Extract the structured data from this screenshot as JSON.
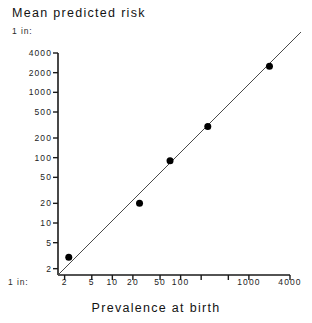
{
  "chart_data": {
    "type": "scatter",
    "title": "Mean predicted risk",
    "xlabel": "Prevalence at birth",
    "ylabel": "Mean predicted risk",
    "x_unit_prefix": "1 in:",
    "y_unit_prefix": "1 in:",
    "xscale": "log",
    "yscale": "log",
    "x_inverted_meaning": "1 in N, larger N to the right",
    "y_inverted_meaning": "1 in N, larger N upward",
    "xlim": [
      1.6,
      4000
    ],
    "ylim": [
      1.6,
      4000
    ],
    "grid": false,
    "legend": null,
    "xticks": [
      2,
      5,
      10,
      20,
      50,
      100,
      200,
      500,
      1000,
      4000
    ],
    "xtick_labels": [
      "2",
      "5",
      "10",
      "20",
      "50",
      "100",
      "",
      "",
      "1000",
      "4000"
    ],
    "yticks": [
      2,
      5,
      10,
      20,
      50,
      100,
      200,
      500,
      1000,
      2000,
      4000
    ],
    "ytick_labels": [
      "2",
      "5",
      "10",
      "20",
      "50",
      "100",
      "200",
      "500",
      "1000",
      "2000",
      "4000"
    ],
    "points": [
      {
        "x": 2.3,
        "y": 3.0
      },
      {
        "x": 25,
        "y": 20
      },
      {
        "x": 70,
        "y": 90
      },
      {
        "x": 250,
        "y": 300
      },
      {
        "x": 2000,
        "y": 2500
      }
    ],
    "reference_line": {
      "kind": "identity",
      "label": "y = x",
      "from": [
        1.6,
        1.6
      ],
      "to": [
        4000,
        4000
      ]
    },
    "marker": {
      "shape": "circle",
      "color": "#000000",
      "size": 7
    },
    "line_color": "#4a4a4a",
    "axis_color": "#1a1a1a"
  }
}
